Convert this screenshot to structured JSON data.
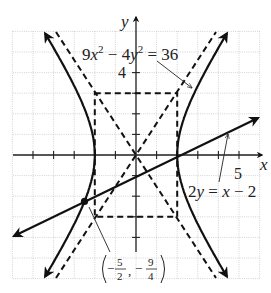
{
  "figure": {
    "axis_labels": {
      "x": "x",
      "y": "y"
    },
    "tick_labels": {
      "x": "5",
      "y": "4"
    },
    "hyperbola_label": {
      "coef1": "9",
      "var1": "x",
      "exp": "2",
      "minus": " − ",
      "coef2": "4",
      "var2": "y",
      "equals": " = 36"
    },
    "line_label": {
      "lhs_coef": "2",
      "lhs_var": "y",
      "rhs": " = ",
      "rhs_var": "x",
      "rhs_rest": " − 2"
    },
    "point_label": {
      "x_num": "5",
      "x_den": "2",
      "y_num": "9",
      "y_den": "4",
      "sign": "−",
      "comma": ","
    }
  },
  "chart_data": {
    "type": "diagram",
    "title": "",
    "xlabel": "x",
    "ylabel": "y",
    "xlim": [
      -6,
      6
    ],
    "ylim": [
      -6,
      6
    ],
    "grid": true,
    "tick_labels": {
      "x": [
        "5"
      ],
      "y": [
        "4"
      ]
    },
    "curves": [
      {
        "name": "hyperbola",
        "equation": "9x^2 - 4y^2 = 36",
        "vertices": [
          [
            -2,
            0
          ],
          [
            2,
            0
          ]
        ],
        "style": "solid, arrows"
      },
      {
        "name": "line",
        "equation": "2y = x - 2",
        "slope": 0.5,
        "y_intercept": -1,
        "style": "solid, arrows"
      },
      {
        "name": "asymptote-1",
        "equation": "y = 1.5x",
        "style": "dashed"
      },
      {
        "name": "asymptote-2",
        "equation": "y = -1.5x",
        "style": "dashed"
      },
      {
        "name": "central-rectangle",
        "corners": [
          [
            -2,
            3
          ],
          [
            2,
            3
          ],
          [
            2,
            -3
          ],
          [
            -2,
            -3
          ]
        ],
        "style": "dashed"
      }
    ],
    "points": [
      {
        "label": "(−5/2, −9/4)",
        "x": -2.5,
        "y": -2.25,
        "marked": true
      },
      {
        "label": "",
        "x": 2,
        "y": 0,
        "marked": false
      }
    ],
    "annotations": [
      "9x² − 4y² = 36",
      "2y = x − 2",
      "(−5/2, −9/4)"
    ]
  }
}
